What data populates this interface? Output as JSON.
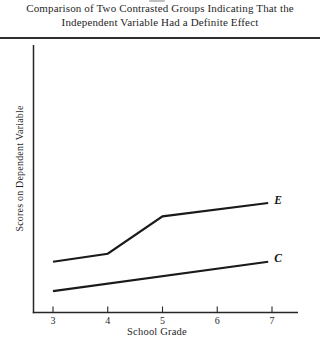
{
  "figure": {
    "title_line1": "Comparison of Two Contrasted Groups Indicating That the",
    "title_line2": "Independent Variable Had a Definite Effect"
  },
  "colors": {
    "line": "#1a1a1a",
    "axis": "#262626",
    "rule": "#2e2e2e",
    "text": "#1f1f1f",
    "background": "#ffffff"
  },
  "chart_data": {
    "type": "line",
    "title": "Comparison of Two Contrasted Groups Indicating That the Independent Variable Had a Definite Effect",
    "xlabel": "School Grade",
    "ylabel": "Scores on Dependent Variable",
    "x_ticks": [
      3,
      4,
      5,
      6,
      7
    ],
    "x_range": [
      3,
      7
    ],
    "ylim": [
      0,
      100
    ],
    "y_unit": "relative score (y-axis shown without tick marks or numbers)",
    "grid": false,
    "legend": "inline italic labels at right end of each line",
    "series": [
      {
        "name": "experimental-group",
        "label": "E",
        "x": [
          3,
          4,
          5,
          6.93
        ],
        "y": [
          19,
          22,
          36,
          41
        ]
      },
      {
        "name": "control-group",
        "label": "C",
        "x": [
          3,
          6.93
        ],
        "y": [
          8,
          19
        ]
      }
    ]
  }
}
